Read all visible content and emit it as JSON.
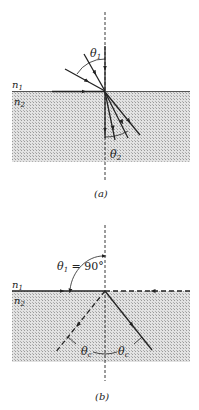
{
  "figure_a": {
    "label_n1": "n",
    "label_n1_sub": "1",
    "label_n2": "n",
    "label_n2_sub": "2",
    "theta1": "θ",
    "theta1_sub": "1",
    "theta2": "θ",
    "theta2_sub": "2",
    "caption": "(a)"
  },
  "figure_b": {
    "label_n1": "n",
    "label_n1_sub": "1",
    "label_n2": "n",
    "label_n2_sub": "2",
    "theta1": "θ",
    "theta1_sub": "1",
    "theta1_value": " = 90°",
    "thetac_left": "θ",
    "thetac_left_sub": "c",
    "thetac_right": "θ",
    "thetac_right_sub": "c",
    "caption": "(b)"
  },
  "colors": {
    "ink": "#222222",
    "medium_fill": "#cfcfcf"
  }
}
